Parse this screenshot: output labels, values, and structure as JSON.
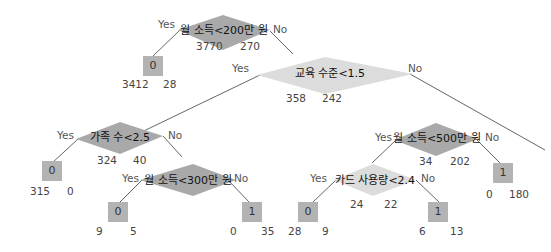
{
  "labels": {
    "yes": "Yes",
    "no": "No"
  },
  "colors": {
    "split_dark": "#a9a9a9",
    "split_light": "#dcdcdc",
    "leaf": "#b3b3b3",
    "edge": "#555555"
  },
  "nodes": {
    "n1": {
      "condition": "월 소득<200만 원",
      "left_count": "3770",
      "right_count": "270"
    },
    "n1_leaf": {
      "class": "0",
      "count_a": "3412",
      "count_b": "28"
    },
    "n2": {
      "condition": "교육 수준<1.5",
      "left_count": "358",
      "right_count": "242"
    },
    "n3": {
      "condition": "가족 수<2.5",
      "left_count": "324",
      "right_count": "40"
    },
    "n3_leaf": {
      "class": "0",
      "count_a": "315",
      "count_b": "0"
    },
    "n4": {
      "condition": "월 소득<300만 원"
    },
    "n4_leaf_yes": {
      "class": "0",
      "count_a": "9",
      "count_b": "5"
    },
    "n4_leaf_no": {
      "class": "1",
      "count_a": "0",
      "count_b": "35"
    },
    "n5": {
      "condition": "월 소득<500만 원",
      "left_count": "34",
      "right_count": "202"
    },
    "n5_leaf": {
      "class": "1",
      "count_a": "0",
      "count_b": "180"
    },
    "n6": {
      "condition": "카드 사용량<2.4",
      "left_count": "24",
      "right_count": "22"
    },
    "n6_leaf_yes": {
      "class": "0",
      "count_a": "28",
      "count_b": "9"
    },
    "n6_leaf_no": {
      "class": "1",
      "count_a": "6",
      "count_b": "13"
    }
  }
}
